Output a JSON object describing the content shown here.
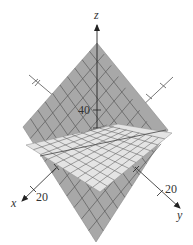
{
  "figure": {
    "axes": {
      "x": {
        "label": "x",
        "tick_label": "20"
      },
      "y": {
        "label": "y",
        "tick_label": "20"
      },
      "z": {
        "label": "z",
        "tick_label": "40"
      }
    },
    "planes": [
      {
        "name": "steep-plane",
        "color": "#a8a8a8"
      },
      {
        "name": "shallow-plane",
        "color": "#e4e4e4"
      }
    ],
    "colors": {
      "axis": "#444444",
      "grid": "#5a5a5a",
      "text": "#333333"
    }
  }
}
